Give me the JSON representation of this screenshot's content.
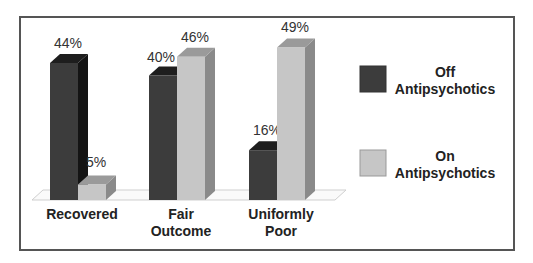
{
  "chart_data": {
    "type": "bar",
    "title": "",
    "xlabel": "",
    "ylabel": "",
    "categories": [
      "Recovered",
      "Fair Outcome",
      "Uniformly Poor"
    ],
    "category_lines": [
      [
        "Recovered"
      ],
      [
        "Fair",
        "Outcome"
      ],
      [
        "Uniformly",
        "Poor"
      ]
    ],
    "series": [
      {
        "name": "Off Antipsychotics",
        "values": [
          44,
          40,
          16
        ],
        "labels": [
          "44%",
          "40%",
          "16%"
        ],
        "color": "#3c3c3c"
      },
      {
        "name": "On Antipsychotics",
        "values": [
          5,
          46,
          49
        ],
        "labels": [
          "5%",
          "46%",
          "49%"
        ],
        "color": "#c6c6c6"
      }
    ],
    "legend": {
      "position": "right",
      "entries": [
        {
          "line1": "Off",
          "line2": "Antipsychotics",
          "color": "#3c3c3c"
        },
        {
          "line1": "On",
          "line2": "Antipsychotics",
          "color": "#c6c6c6"
        }
      ]
    },
    "grid": false,
    "ylim": [
      0,
      50
    ],
    "style": "3d-clustered-column"
  }
}
